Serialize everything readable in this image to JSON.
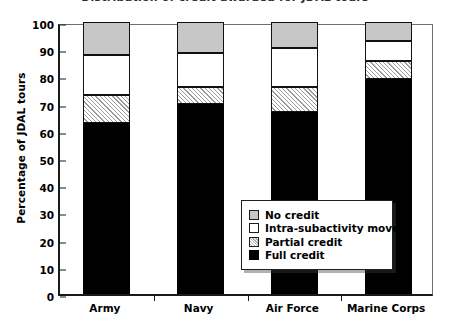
{
  "figure": {
    "cropped_title": "Distribution of credit awarded for JDAL tours"
  },
  "axes": {
    "ylabel": "Percentage of JDAL tours",
    "yticks": [
      "0",
      "10",
      "20",
      "30",
      "40",
      "50",
      "60",
      "70",
      "80",
      "90",
      "100"
    ],
    "xticklabels": [
      "Army",
      "Navy",
      "Air Force",
      "Marine Corps"
    ]
  },
  "legend": {
    "items": [
      {
        "label": "No credit",
        "swatch": "gray"
      },
      {
        "label": "Intra-subactivity move",
        "swatch": "white"
      },
      {
        "label": "Partial credit",
        "swatch": "hatch"
      },
      {
        "label": "Full credit",
        "swatch": "black"
      }
    ]
  },
  "chart_data": {
    "type": "bar",
    "stacked": true,
    "title": "Distribution of credit awarded for JDAL tours",
    "xlabel": "",
    "ylabel": "Percentage of JDAL tours",
    "ylim": [
      0,
      100
    ],
    "ytick_step": 10,
    "grid": false,
    "legend_position": "inside-lower-right",
    "categories": [
      "Army",
      "Navy",
      "Air Force",
      "Marine Corps"
    ],
    "series": [
      {
        "name": "Full credit",
        "color": "#000000",
        "values": [
          63,
          70,
          67,
          79
        ]
      },
      {
        "name": "Partial credit",
        "color": "#ffffff",
        "pattern": "hatch",
        "values": [
          10,
          6,
          9,
          6.5
        ]
      },
      {
        "name": "Intra-subactivity move",
        "color": "#ffffff",
        "values": [
          15,
          12.5,
          14.5,
          7.5
        ]
      },
      {
        "name": "No credit",
        "color": "#c7c7c7",
        "values": [
          12,
          11.5,
          9.5,
          7
        ]
      }
    ],
    "cumulative_tops": {
      "Army": {
        "Full credit": 63,
        "Partial credit": 73,
        "Intra-subactivity move": 88,
        "No credit": 100
      },
      "Navy": {
        "Full credit": 70,
        "Partial credit": 76,
        "Intra-subactivity move": 88.5,
        "No credit": 100
      },
      "Air Force": {
        "Full credit": 67,
        "Partial credit": 76,
        "Intra-subactivity move": 90.5,
        "No credit": 100
      },
      "Marine Corps": {
        "Full credit": 79,
        "Partial credit": 85.5,
        "Intra-subactivity move": 93,
        "No credit": 100
      }
    }
  }
}
